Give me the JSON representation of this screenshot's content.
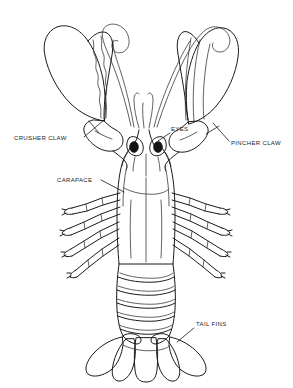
{
  "figure": {
    "background_color": "#ffffff",
    "ink_color": "#1a1a1a",
    "width": 293,
    "height": 388
  },
  "labels": [
    {
      "id": "crusher-claw",
      "text": "CRUSHER CLAW",
      "x": 14,
      "y": 140,
      "anchor": "start",
      "leader": "M84,137 L104,120"
    },
    {
      "id": "eyes",
      "text": "EYES",
      "x": 171,
      "y": 131,
      "anchor": "start",
      "leader": "M170,133 L158,141"
    },
    {
      "id": "pincher-claw",
      "text": "PINCHER CLAW",
      "x": 231,
      "y": 145,
      "anchor": "start",
      "leader": "M229,141 L214,124"
    },
    {
      "id": "carapace",
      "text": "CARAPACE",
      "x": 57,
      "y": 182,
      "anchor": "start",
      "leader": "M101,180 L124,192"
    },
    {
      "id": "tail-fins",
      "text": "TAIL FINS",
      "x": 196,
      "y": 326,
      "anchor": "start",
      "leader": "M194,328 L178,341"
    }
  ],
  "parts": {
    "antennae": "two long curling antennae with spiral tips",
    "eyes": "two black stalked compound eyes",
    "crusher_claw": "large left claw with serrated inner edge",
    "pincher_claw": "narrow right claw with parallel ridges",
    "carapace": "head and thorax shell",
    "walking_legs": "four pairs of segmented legs with pincer tips",
    "abdomen": "six segmented tail sections",
    "tail_fins": "fan-shaped telson and uropods"
  }
}
